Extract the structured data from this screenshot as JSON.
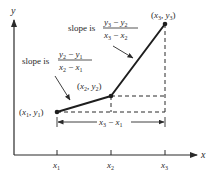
{
  "diagram": {
    "axes": {
      "x_label": "x",
      "y_label": "y",
      "x_ticks": [
        "x1",
        "x2",
        "x3"
      ]
    },
    "points": [
      {
        "name": "P1",
        "label": "(x1, y1)"
      },
      {
        "name": "P2",
        "label": "(x2, y2)"
      },
      {
        "name": "P3",
        "label": "(x3, y3)"
      }
    ],
    "annotations": {
      "slope1": {
        "prefix": "slope is",
        "numerator": "y2 − y1",
        "denominator": "x2 − x1"
      },
      "slope2": {
        "prefix": "slope is",
        "numerator": "y3 − y2",
        "denominator": "x3 − x2"
      },
      "span": "x3 − x1"
    },
    "colors": {
      "ink": "#2a2a2a",
      "background": "#ffffff"
    }
  }
}
